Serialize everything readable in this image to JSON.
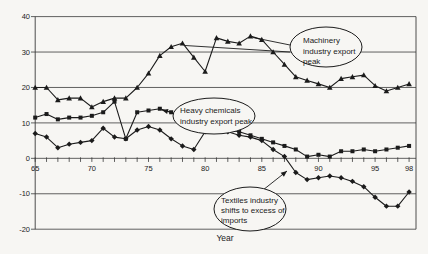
{
  "page": {
    "background": "#f7f6f3",
    "ink": "#1b1b1b",
    "grid_color": "#3a3a3a"
  },
  "chart_data": {
    "type": "line",
    "title": "",
    "xlabel": "Year",
    "x_start": 65,
    "x_end": 98,
    "xticks_major": [
      65,
      70,
      75,
      80,
      85,
      90,
      95,
      98
    ],
    "ylim": [
      -20,
      40
    ],
    "yticks": [
      -20,
      -10,
      0,
      10,
      20,
      30,
      40
    ],
    "grid": true,
    "legend_position": "none",
    "series": [
      {
        "name": "Machinery",
        "marker": "triangle",
        "values": [
          20,
          20,
          16.5,
          17,
          17,
          14.5,
          16,
          17,
          17,
          20,
          24,
          29,
          31.5,
          32.5,
          28.5,
          24.5,
          34,
          33,
          32.5,
          34.5,
          33.5,
          30,
          26.5,
          23,
          22,
          21,
          20,
          22.5,
          23,
          23.5,
          20.5,
          19,
          20,
          21
        ]
      },
      {
        "name": "Heavy chemicals",
        "marker": "square",
        "values": [
          11.5,
          12.5,
          11,
          11.5,
          11.5,
          12,
          13,
          16,
          5.5,
          13,
          13.5,
          14,
          13,
          11.5,
          10,
          8.5,
          8.5,
          8,
          7.5,
          6.5,
          5.5,
          4.5,
          3.5,
          2.5,
          0.5,
          1,
          0.5,
          2,
          2,
          2.5,
          2,
          2.5,
          3,
          3.5
        ]
      },
      {
        "name": "Textiles",
        "marker": "diamond",
        "values": [
          7,
          6,
          3,
          4,
          4.5,
          5,
          8.5,
          6,
          5.5,
          8,
          9,
          8,
          5.5,
          3.5,
          2.5,
          7.5,
          8,
          7.5,
          6.5,
          6,
          5,
          2.5,
          0.5,
          -4,
          -6,
          -5.5,
          -5,
          -5.5,
          -6.5,
          -8,
          -11,
          -13.5,
          -13.5,
          -9.5
        ]
      }
    ],
    "annotations": [
      {
        "id": "machinery-peak",
        "text_lines": [
          "Machinery",
          "industry export",
          "peak"
        ],
        "ellipse": {
          "cx": 326,
          "cy": 47,
          "rx": 36,
          "ry": 20
        },
        "text_x": 303,
        "text_y": 43,
        "line_h": 10.5,
        "leaders": [
          {
            "from": [
              290,
              52
            ],
            "to": [
              185,
              45.5
            ],
            "arrow": false
          },
          {
            "from": [
              290,
              45
            ],
            "to": [
              253,
              37.5
            ],
            "arrow": false
          }
        ]
      },
      {
        "id": "heavy-chemicals-peak",
        "text_lines": [
          "Heavy chemicals",
          "industry export peak"
        ],
        "ellipse": {
          "cx": 214,
          "cy": 116,
          "rx": 41,
          "ry": 18
        },
        "text_x": 180,
        "text_y": 113,
        "line_h": 11,
        "leaders": [
          {
            "from": [
              173,
              113
            ],
            "to": [
              162,
              110
            ],
            "arrow": true
          }
        ]
      },
      {
        "id": "textiles-import-shift",
        "text_lines": [
          "Textiles industry",
          "shifts to excess of",
          "imports"
        ],
        "ellipse": {
          "cx": 250,
          "cy": 209,
          "rx": 36,
          "ry": 22
        },
        "text_x": 221,
        "text_y": 203,
        "line_h": 10,
        "leaders": [
          {
            "from": [
              263,
              190
            ],
            "to": [
              287,
              171
            ],
            "arrow": true
          }
        ]
      }
    ]
  }
}
